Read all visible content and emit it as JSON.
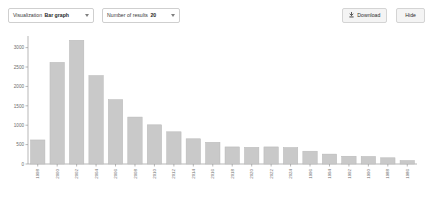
{
  "toolbar": {
    "visualization": {
      "label": "Visualization",
      "value": "Bar graph",
      "caret_icon": "chevron-down-icon"
    },
    "results": {
      "label": "Number of results",
      "value": "20",
      "caret_icon": "chevron-down-icon"
    },
    "download_label": "Download",
    "download_icon": "download-icon",
    "hide_label": "Hide"
  },
  "style": {
    "bar_fill": "#c9c9c9",
    "bar_stroke": "#b8b8b8",
    "axis_color": "#9a9a9a",
    "tick_text_color": "#6b6b6b",
    "panel_bg": "#ffffff",
    "button_bg": "#f4f4f4",
    "button_border": "#d4d4d4"
  },
  "chart_data": {
    "type": "bar",
    "title": "",
    "xlabel": "",
    "ylabel": "",
    "ylim": [
      0,
      3300
    ],
    "yticks": [
      0,
      500,
      1000,
      1500,
      2000,
      2500,
      3000
    ],
    "ytick_labels": [
      "0",
      "500",
      "1000",
      "1500",
      "2000",
      "2500",
      "3000"
    ],
    "grid": false,
    "legend": false,
    "xtick_rotation": -90,
    "categories": [
      "1998",
      "2000",
      "2002",
      "2004",
      "2006",
      "2008",
      "2010",
      "2012",
      "2014",
      "2016",
      "2018",
      "2020",
      "2022",
      "2024",
      "1996",
      "1994",
      "1992",
      "1990",
      "1988",
      "1986"
    ],
    "values": [
      620,
      2620,
      3190,
      2280,
      1660,
      1210,
      1010,
      830,
      650,
      560,
      440,
      430,
      440,
      425,
      330,
      255,
      200,
      195,
      160,
      90
    ]
  }
}
